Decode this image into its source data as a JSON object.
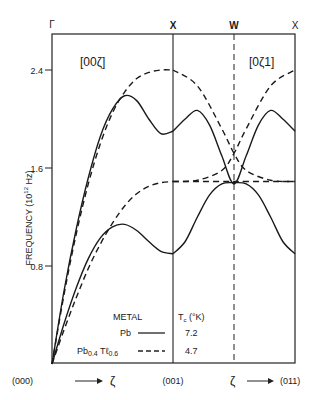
{
  "chart_data": {
    "type": "line",
    "title": "",
    "xlabel": "",
    "ylabel": "FREQUENCY (10^12 Hz)",
    "ylabel_text": "FREQUENCY (10",
    "ylabel_exp": "12",
    "ylabel_unit": " Hz)",
    "ylim": [
      0,
      2.65
    ],
    "yticks": [
      0.8,
      1.6,
      2.4
    ],
    "ytick_labels": [
      "0.8",
      "1.6",
      "2.4"
    ],
    "grid": false,
    "symmetry_points": [
      {
        "label": "Γ",
        "pos": 0.0
      },
      {
        "label": "X",
        "pos": 1.0
      },
      {
        "label": "W",
        "pos": 1.5
      },
      {
        "label": "X",
        "pos": 2.0
      }
    ],
    "bottom_labels": {
      "start": "(000)",
      "arrow1": "ζ",
      "mid": "(001)",
      "arrow2": "ζ",
      "end": "(011)"
    },
    "panel_labels": [
      "[00ζ]",
      "[0ζ1]"
    ],
    "legend": {
      "header_metal": "METAL",
      "header_tc": "Tc (°K)",
      "entries": [
        {
          "name": "Pb",
          "style": "solid",
          "tc": "7.2"
        },
        {
          "name": "Pb0.4Tl0.6",
          "style": "dashed",
          "tc": "4.7"
        }
      ]
    },
    "series": [
      {
        "name": "Pb L [00ζ]",
        "material": "Pb",
        "style": "solid",
        "x": [
          0,
          0.1,
          0.2,
          0.3,
          0.4,
          0.5,
          0.6,
          0.7,
          0.8,
          0.9,
          1.0
        ],
        "values": [
          0,
          0.6,
          1.1,
          1.52,
          1.86,
          2.08,
          2.19,
          2.15,
          2.0,
          1.88,
          1.9
        ]
      },
      {
        "name": "Pb T [00ζ]",
        "material": "Pb",
        "style": "solid",
        "x": [
          0,
          0.1,
          0.2,
          0.3,
          0.4,
          0.5,
          0.6,
          0.7,
          0.8,
          0.9,
          1.0
        ],
        "values": [
          0,
          0.33,
          0.62,
          0.86,
          1.03,
          1.12,
          1.14,
          1.09,
          1.0,
          0.92,
          0.9
        ]
      },
      {
        "name": "PbTl L [00ζ]",
        "material": "Pb0.4Tl0.6",
        "style": "dashed",
        "x": [
          0,
          0.1,
          0.2,
          0.3,
          0.4,
          0.5,
          0.6,
          0.7,
          0.8,
          0.9,
          1.0
        ],
        "values": [
          0,
          0.57,
          1.06,
          1.47,
          1.8,
          2.05,
          2.22,
          2.33,
          2.38,
          2.4,
          2.4
        ]
      },
      {
        "name": "PbTl T [00ζ]",
        "material": "Pb0.4Tl0.6",
        "style": "dashed",
        "x": [
          0,
          0.1,
          0.2,
          0.3,
          0.4,
          0.5,
          0.6,
          0.7,
          0.8,
          0.9,
          1.0
        ],
        "values": [
          0,
          0.28,
          0.54,
          0.78,
          0.98,
          1.15,
          1.29,
          1.39,
          1.45,
          1.48,
          1.49
        ]
      },
      {
        "name": "Pb upper [0ζ1]",
        "material": "Pb",
        "style": "solid",
        "x": [
          1.0,
          1.1,
          1.2,
          1.3,
          1.4,
          1.5,
          1.6,
          1.7,
          1.8,
          1.9,
          2.0
        ],
        "values": [
          1.9,
          2.0,
          2.07,
          1.95,
          1.7,
          1.47,
          1.7,
          1.95,
          2.07,
          2.0,
          1.9
        ]
      },
      {
        "name": "Pb lower [0ζ1]",
        "material": "Pb",
        "style": "solid",
        "x": [
          1.0,
          1.1,
          1.2,
          1.3,
          1.4,
          1.5,
          1.6,
          1.7,
          1.8,
          1.9,
          2.0
        ],
        "values": [
          0.9,
          1.0,
          1.2,
          1.38,
          1.47,
          1.48,
          1.47,
          1.38,
          1.2,
          1.0,
          0.9
        ]
      },
      {
        "name": "PbTl falling [0ζ1]",
        "material": "Pb0.4Tl0.6",
        "style": "dashed",
        "x": [
          1.0,
          1.2,
          1.4,
          1.5,
          1.6,
          1.8,
          2.0
        ],
        "values": [
          2.4,
          2.27,
          1.92,
          1.72,
          1.58,
          1.5,
          1.49
        ]
      },
      {
        "name": "PbTl rising [0ζ1]",
        "material": "Pb0.4Tl0.6",
        "style": "dashed",
        "x": [
          1.0,
          1.2,
          1.4,
          1.5,
          1.6,
          1.8,
          2.0
        ],
        "values": [
          1.49,
          1.5,
          1.58,
          1.72,
          1.92,
          2.27,
          2.4
        ]
      },
      {
        "name": "PbTl flat [0ζ1]",
        "material": "Pb0.4Tl0.6",
        "style": "dashed",
        "x": [
          1.0,
          1.5,
          2.0
        ],
        "values": [
          1.49,
          1.49,
          1.49
        ]
      }
    ]
  }
}
